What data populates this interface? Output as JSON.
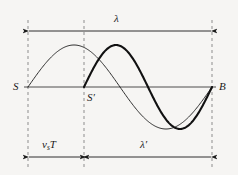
{
  "figure": {
    "background_color": "#f6f5f3",
    "line_color": "#1a1a1a",
    "dashed_color": "#8a8a8a",
    "labels": {
      "source_start": "S",
      "source_moved": "S′",
      "observer": "B",
      "wavelength": "λ",
      "wavelength_shifted": "λ′",
      "source_displacement_v": "v",
      "source_displacement_sub": "s",
      "source_displacement_T": "T"
    },
    "geometry": {
      "axis_y": 87,
      "x_S": 28,
      "x_Sprime": 84,
      "x_B": 212,
      "top_dim_y": 31,
      "bottom_dim_y": 157,
      "dash_top_y": 20,
      "dash_bottom_y": 168,
      "peak_y": 45,
      "trough_y": 127,
      "amplitude": 42
    },
    "curves": [
      {
        "name": "original-wave",
        "stroke_width": 0.9,
        "x_start": 28,
        "x_end": 212,
        "wavelength_px": 184,
        "description": "thin sine, one full wavelength from S to B"
      },
      {
        "name": "doppler-shifted-wave",
        "stroke_width": 2.1,
        "x_start": 84,
        "x_end": 212,
        "wavelength_px": 128,
        "description": "thick sine, one full compressed wavelength from S-prime to B"
      }
    ],
    "dimensions": [
      {
        "name": "lambda",
        "from_x": 28,
        "to_x": 212,
        "y": 31,
        "label": "λ"
      },
      {
        "name": "vsT",
        "from_x": 28,
        "to_x": 84,
        "y": 157,
        "label": "v_sT"
      },
      {
        "name": "lambda-prime",
        "from_x": 84,
        "to_x": 212,
        "y": 157,
        "label": "λ′"
      }
    ]
  }
}
